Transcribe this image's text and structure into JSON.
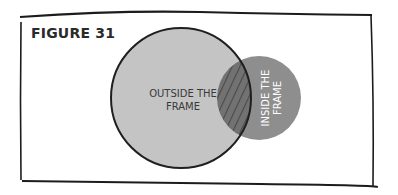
{
  "figure": {
    "title": "FIGURE 31"
  },
  "diagram": {
    "type": "venn",
    "sets": [
      {
        "label_lines": [
          "OUTSIDE THE",
          "FRAME"
        ],
        "fill": "#c4c4c4",
        "stroke": "#1f1f1f",
        "text_color": "#3a3a3a"
      },
      {
        "label_lines": [
          "INSIDE THE",
          "FRAME"
        ],
        "fill": "#8e8e8e",
        "stroke": "none",
        "text_color": "#ffffff"
      }
    ],
    "overlap": {
      "pattern": "diagonal-hatch",
      "fill": "#6e6e6e",
      "hatch_color": "#4a4a4a"
    }
  }
}
